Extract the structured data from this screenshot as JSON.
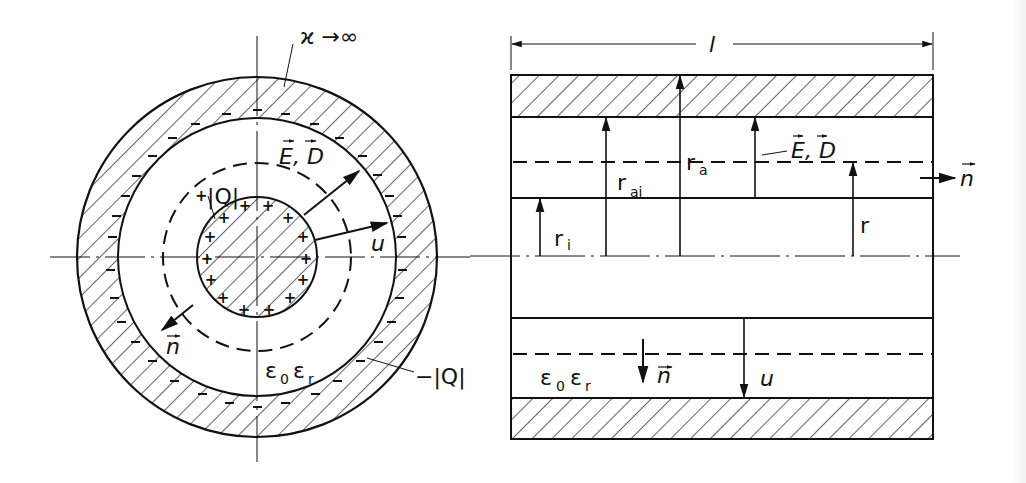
{
  "figure": {
    "left_view": {
      "name": "cross-section of coaxial cable",
      "labels": {
        "conductivity": "ϰ →∞",
        "field": "E, D",
        "inner_charge": "|Q|",
        "inner_charge_sign": "+",
        "outer_charge": "−|Q|",
        "voltage": "u",
        "normal": "n",
        "permittivity_main": "ε",
        "permittivity_sub0": "0",
        "permittivity_main2": "ε",
        "permittivity_sub_r": "r"
      },
      "charge_symbols": {
        "inner": "+",
        "outer": "−"
      }
    },
    "right_view": {
      "name": "longitudinal section of coaxial cable",
      "labels": {
        "length": "l",
        "r_i_main": "r",
        "r_i_sub": "i",
        "r_ai_main": "r",
        "r_ai_sub": "ai",
        "r_a_main": "r",
        "r_a_sub": "a",
        "field": "E, D",
        "radius": "r",
        "normal_right": "n",
        "normal_down": "n",
        "voltage": "u",
        "permittivity_main": "ε",
        "permittivity_sub0": "0",
        "permittivity_main2": "ε",
        "permittivity_sub_r": "r"
      }
    },
    "colors": {
      "ink": "#111111",
      "paper": "#ffffff"
    }
  }
}
